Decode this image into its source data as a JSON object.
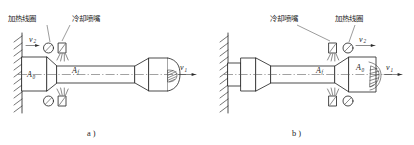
{
  "figure": {
    "background_color": "#ffffff",
    "line_color": "#2a2a2a",
    "panels": [
      {
        "id": "a",
        "caption": "a )",
        "orientation": "wall-left-billet-right",
        "labels": {
          "heating_coil": "加热线圈",
          "cooling_nozzle": "冷却喷嘴",
          "area_initial": "A",
          "area_initial_sub": "0",
          "area_final": "A",
          "area_final_sub": "f",
          "velocity_feed": "v",
          "velocity_feed_sub": "2",
          "velocity_draw": "v",
          "velocity_draw_sub": "1"
        }
      },
      {
        "id": "b",
        "caption": "b )",
        "orientation": "wall-left-billet-right-mirrored",
        "labels": {
          "cooling_nozzle": "冷却喷嘴",
          "heating_coil": "加热线圈",
          "area_final": "A",
          "area_final_sub": "f",
          "area_initial": "A",
          "area_initial_sub": "0",
          "velocity_feed": "v",
          "velocity_feed_sub": "2",
          "velocity_draw": "v",
          "velocity_draw_sub": "1"
        }
      }
    ]
  }
}
